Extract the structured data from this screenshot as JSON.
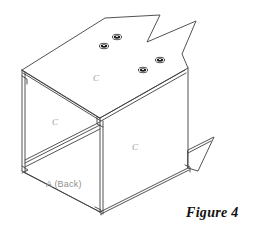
{
  "figure": {
    "caption": "Figure 4",
    "caption_x": 186,
    "caption_y": 206
  },
  "drawing": {
    "type": "isometric-line-drawing",
    "subject": "open-box-cabinet-assembly",
    "line_color": "#3a3a3a",
    "background_color": "#ffffff",
    "stroke_width": 0.9
  },
  "labels": [
    {
      "name": "top-panel-label",
      "text": "C",
      "x": 93,
      "y": 74
    },
    {
      "name": "left-panel-label",
      "text": "C",
      "x": 52,
      "y": 118
    },
    {
      "name": "front-panel-label",
      "text": "C",
      "x": 132,
      "y": 143
    },
    {
      "name": "back-panel-label",
      "text": "A (Back)",
      "x": 46,
      "y": 180
    }
  ],
  "holes": [
    {
      "name": "hole-1",
      "cx": 117,
      "cy": 37,
      "rx": 4.6,
      "ry": 2.7
    },
    {
      "name": "hole-2",
      "cx": 104,
      "cy": 46,
      "rx": 4.6,
      "ry": 2.7
    },
    {
      "name": "hole-3",
      "cx": 160,
      "cy": 60,
      "rx": 4.6,
      "ry": 2.7
    },
    {
      "name": "hole-4",
      "cx": 143,
      "cy": 70,
      "rx": 4.6,
      "ry": 2.7
    }
  ],
  "geometry": {
    "top_panel_outline": "105,18 160,15 160,41 190,22 190,22 182,52 182,52",
    "left_top_corner": {
      "x": 22,
      "y": 70
    },
    "center_top_corner": {
      "x": 100,
      "y": 118
    },
    "right_top_corner": {
      "x": 188,
      "y": 68
    },
    "center_bottom_corner": {
      "x": 100,
      "y": 212
    },
    "left_bottom_corner": {
      "x": 22,
      "y": 171
    },
    "right_bottom_corner": {
      "x": 188,
      "y": 168
    }
  }
}
